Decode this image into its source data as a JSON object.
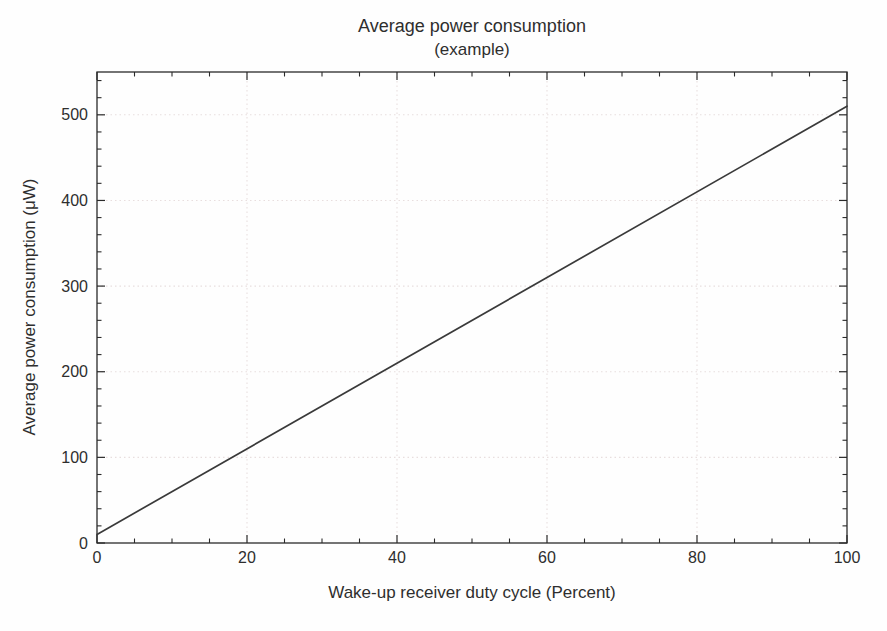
{
  "figure": {
    "title": "Average power consumption",
    "subtitle": "(example)"
  },
  "chart_data": {
    "type": "line",
    "title": "Average power consumption",
    "subtitle": "(example)",
    "xlabel": "Wake-up receiver duty cycle (Percent)",
    "ylabel": "Average power consumption (μW)",
    "xlim": [
      0,
      100
    ],
    "ylim": [
      0,
      550
    ],
    "x_major_ticks": [
      0,
      20,
      40,
      60,
      80,
      100
    ],
    "x_tick_labels": [
      "0",
      "20",
      "40",
      "60",
      "80",
      "100"
    ],
    "x_minor_step": 5,
    "y_major_ticks": [
      0,
      100,
      200,
      300,
      400,
      500
    ],
    "y_tick_labels": [
      "0",
      "100",
      "200",
      "300",
      "400",
      "500"
    ],
    "y_minor_step": 20,
    "grid": "dotted gridlines at major ticks, both axes",
    "legend": "none",
    "box": "ticks on all four sides, pointing inward",
    "series": [
      {
        "name": "average power consumption",
        "x": [
          0,
          100
        ],
        "y": [
          10,
          510
        ]
      }
    ],
    "colors": {
      "line": "#3a3a3a",
      "axis": "#2a2a2a",
      "grid": "#e8dede",
      "text": "#2e2e2e",
      "background": "#fefefe"
    }
  }
}
